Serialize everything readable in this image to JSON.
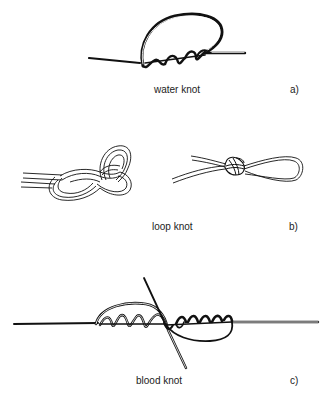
{
  "figure": {
    "panels": [
      {
        "id": "a",
        "name": "water knot",
        "letter": "a)"
      },
      {
        "id": "b",
        "name": "loop knot",
        "letter": "b)"
      },
      {
        "id": "c",
        "name": "blood knot",
        "letter": "c)"
      }
    ],
    "colors": {
      "line": "#111111",
      "text": "#222222",
      "background": "#ffffff"
    }
  }
}
